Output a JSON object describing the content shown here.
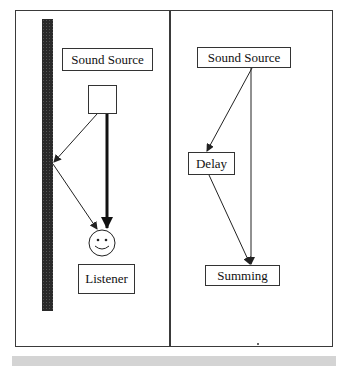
{
  "left_panel": {
    "title": "Direct and reflected sound",
    "source_label": "Sound Source",
    "listener_label": "Listener",
    "wall": "reflecting-wall",
    "listener_icon": "smiley-face-icon",
    "speaker_icon": "square-source-icon"
  },
  "right_panel": {
    "source_label": "Sound Source",
    "delay_label": "Delay",
    "summing_label": "Summing"
  },
  "colors": {
    "line": "#222222",
    "wall": "#2a2a2a",
    "footer": "#d4d4d4"
  }
}
